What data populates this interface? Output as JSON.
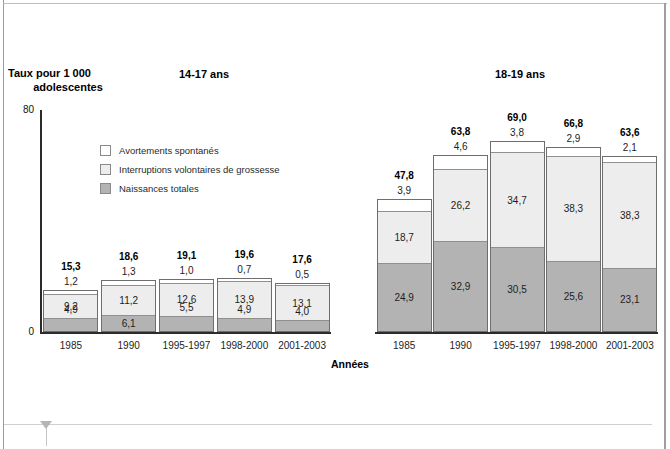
{
  "figure": {
    "y_axis_title_line1": "Taux pour 1 000",
    "y_axis_title_line2": "adolescentes",
    "x_axis_caption": "Années",
    "y_ticks": [
      "80",
      "0"
    ]
  },
  "legend": {
    "items": [
      {
        "label": "Avortements spontanés",
        "swatch": "white",
        "color": "#ffffff"
      },
      {
        "label": "Interruptions volontaires de grossesse",
        "swatch": "light",
        "color": "#ededed"
      },
      {
        "label": "Naissances totales",
        "swatch": "mid",
        "color": "#b3b3b3"
      }
    ]
  },
  "panels": {
    "left": {
      "title": "14-17 ans"
    },
    "right": {
      "title": "18-19 ans"
    }
  },
  "chart_data": [
    {
      "type": "bar",
      "stacked": true,
      "title": "14-17 ans",
      "xlabel": "Années",
      "ylabel": "Taux pour 1 000 adolescentes",
      "ylim": [
        0,
        80
      ],
      "grid": false,
      "legend_position": "inside-upper-left",
      "categories": [
        "1985",
        "1990",
        "1995-1997",
        "1998-2000",
        "2001-2003"
      ],
      "series": [
        {
          "name": "Naissances totales",
          "color": "#b3b3b3",
          "values": [
            4.9,
            6.1,
            5.5,
            4.9,
            4.0
          ],
          "labels": [
            "4,9",
            "6,1",
            "5,5",
            "4,9",
            "4,0"
          ]
        },
        {
          "name": "Interruptions volontaires de grossesse",
          "color": "#ededed",
          "values": [
            9.2,
            11.2,
            12.6,
            13.9,
            13.1
          ],
          "labels": [
            "9,2",
            "11,2",
            "12,6",
            "13,9",
            "13,1"
          ]
        },
        {
          "name": "Avortements spontanés",
          "color": "#ffffff",
          "values": [
            1.2,
            1.3,
            1.0,
            0.7,
            0.5
          ],
          "labels": [
            "1,2",
            "1,3",
            "1,0",
            "0,7",
            "0,5"
          ]
        }
      ],
      "totals": [
        15.3,
        18.6,
        19.1,
        19.6,
        17.6
      ],
      "total_labels": [
        "15,3",
        "18,6",
        "19,1",
        "19,6",
        "17,6"
      ]
    },
    {
      "type": "bar",
      "stacked": true,
      "title": "18-19 ans",
      "xlabel": "Années",
      "ylabel": "Taux pour 1 000 adolescentes",
      "ylim": [
        0,
        80
      ],
      "grid": false,
      "categories": [
        "1985",
        "1990",
        "1995-1997",
        "1998-2000",
        "2001-2003"
      ],
      "series": [
        {
          "name": "Naissances totales",
          "color": "#b3b3b3",
          "values": [
            24.9,
            32.9,
            30.5,
            25.6,
            23.1
          ],
          "labels": [
            "24,9",
            "32,9",
            "30,5",
            "25,6",
            "23,1"
          ]
        },
        {
          "name": "Interruptions volontaires de grossesse",
          "color": "#ededed",
          "values": [
            18.7,
            26.2,
            34.7,
            38.3,
            38.3
          ],
          "labels": [
            "18,7",
            "26,2",
            "34,7",
            "38,3",
            "38,3"
          ]
        },
        {
          "name": "Avortements spontanés",
          "color": "#ffffff",
          "values": [
            3.9,
            4.6,
            3.8,
            2.9,
            2.1
          ],
          "labels": [
            "3,9",
            "4,6",
            "3,8",
            "2,9",
            "2,1"
          ]
        }
      ],
      "totals": [
        47.8,
        63.8,
        69.0,
        66.8,
        63.6
      ],
      "total_labels": [
        "47,8",
        "63,8",
        "69,0",
        "66,8",
        "63,6"
      ]
    }
  ]
}
